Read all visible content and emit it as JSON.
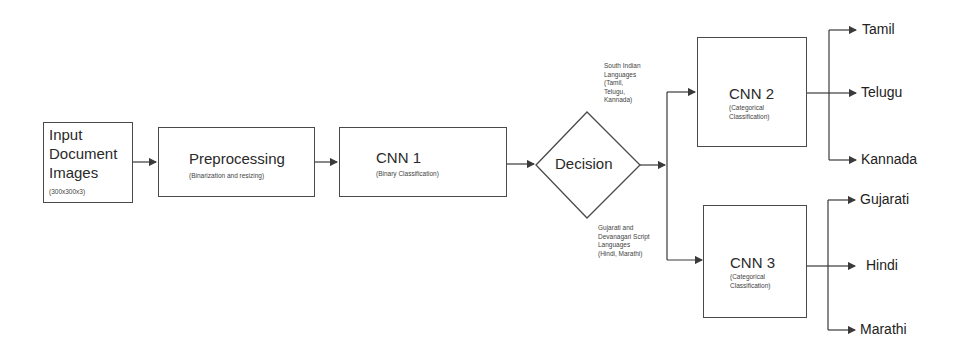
{
  "diagram": {
    "nodes": {
      "input": {
        "title_lines": [
          "Input",
          "Document",
          "Images"
        ],
        "subtitle": "(300x300x3)"
      },
      "preprocessing": {
        "title": "Preprocessing",
        "subtitle": "(Binarization and resizing)"
      },
      "cnn1": {
        "title": "CNN 1",
        "subtitle": "(Binary Classification)"
      },
      "decision": {
        "title": "Decision"
      },
      "cnn2": {
        "title": "CNN 2",
        "subtitle_lines": [
          "(Categorical",
          "Classification)"
        ]
      },
      "cnn3": {
        "title": "CNN 3",
        "subtitle_lines": [
          "(Categorical",
          "Classification)"
        ]
      }
    },
    "branch_labels": {
      "south": [
        "South Indian",
        "Languages",
        "(Tamil,",
        "Telugu,",
        "Kannada)"
      ],
      "north": [
        "Gujarati and",
        "Devanagari Script",
        "Languages",
        "(Hindi, Marathi)"
      ]
    },
    "outputs": {
      "cnn2": [
        "Tamil",
        "Telugu",
        "Kannada"
      ],
      "cnn3": [
        "Gujarati",
        "Hindi",
        "Marathi"
      ]
    },
    "colors": {
      "line": "#3a3a3a",
      "box_border": "#4a4a4a",
      "background": "#ffffff"
    }
  }
}
